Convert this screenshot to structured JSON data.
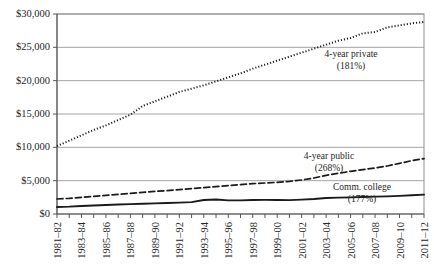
{
  "chart_data": {
    "type": "line",
    "title": "",
    "subtitle": "",
    "xlabel": "",
    "ylabel": "",
    "ylim": [
      0,
      30000
    ],
    "ytick_values": [
      0,
      5000,
      10000,
      15000,
      20000,
      25000,
      30000
    ],
    "ytick_labels": [
      "$0",
      "$5,000",
      "$10,000",
      "$15,000",
      "$20,000",
      "$25,000",
      "$30,000"
    ],
    "grid": "horizontal",
    "legend_position": "inline-annotations",
    "x": [
      "1981–82",
      "1982–83",
      "1983–84",
      "1984–85",
      "1985–86",
      "1986–87",
      "1987–88",
      "1988–89",
      "1989–90",
      "1990–91",
      "1991–92",
      "1992–93",
      "1993–94",
      "1994–95",
      "1995–96",
      "1996–97",
      "1997–98",
      "1998–99",
      "1999–00",
      "2000–01",
      "2001–02",
      "2002–03",
      "2003–04",
      "2004–05",
      "2005–06",
      "2006–07",
      "2007–08",
      "2008–09",
      "2009–10",
      "2010–11",
      "2011–12"
    ],
    "xtick_labels_shown": [
      "1981–82",
      "1983–84",
      "1985–86",
      "1987–88",
      "1989–90",
      "1991–92",
      "1993–94",
      "1995–96",
      "1997–98",
      "1999–00",
      "2001–02",
      "2003–04",
      "2005–06",
      "2007–08",
      "2009–10",
      "2011–12"
    ],
    "series": [
      {
        "name": "4-year private",
        "style": "dotted",
        "color": "#1a1a1a",
        "annotation_label": "4-year private",
        "annotation_value": "(181%)",
        "values": [
          10200,
          11000,
          11800,
          12600,
          13300,
          14100,
          14900,
          16200,
          16900,
          17600,
          18300,
          18800,
          19300,
          19900,
          20500,
          21100,
          21800,
          22400,
          23000,
          23600,
          24200,
          24800,
          25400,
          26000,
          26400,
          27100,
          27300,
          28000,
          28300,
          28600,
          28800
        ]
      },
      {
        "name": "4-year public",
        "style": "dashed",
        "color": "#1a1a1a",
        "annotation_label": "4-year public",
        "annotation_value": "(268%)",
        "values": [
          2250,
          2350,
          2500,
          2650,
          2800,
          2950,
          3100,
          3250,
          3400,
          3500,
          3650,
          3800,
          3950,
          4100,
          4250,
          4400,
          4550,
          4650,
          4750,
          4900,
          5100,
          5400,
          5800,
          6100,
          6400,
          6650,
          6900,
          7200,
          7600,
          8000,
          8300
        ]
      },
      {
        "name": "Comm. college",
        "style": "solid",
        "color": "#1a1a1a",
        "annotation_label": "Comm. college",
        "annotation_value": "(177%)",
        "values": [
          1050,
          1100,
          1200,
          1280,
          1350,
          1420,
          1480,
          1540,
          1600,
          1650,
          1700,
          1780,
          2100,
          2180,
          2050,
          2050,
          2100,
          2120,
          2100,
          2080,
          2150,
          2250,
          2400,
          2450,
          2500,
          2550,
          2600,
          2650,
          2720,
          2820,
          2900
        ]
      }
    ],
    "annotations": [
      {
        "name": "4-year-private-annotation",
        "label": "4-year private",
        "value": "(181%)"
      },
      {
        "name": "4-year-public-annotation",
        "label": "4-year public",
        "value": "(268%)"
      },
      {
        "name": "comm-college-annotation",
        "label": "Comm. college",
        "value": "(177%)"
      }
    ],
    "colors": {
      "gridline": "#9a9a9a",
      "axis": "#555555",
      "text": "#262626",
      "plot_border": "#8c8c8c",
      "background": "#ffffff"
    }
  }
}
